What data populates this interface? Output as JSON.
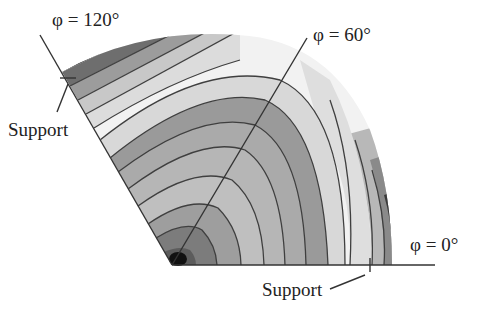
{
  "figure": {
    "type": "contour-plot",
    "labels": {
      "phi_120": "φ = 120°",
      "phi_60": "φ = 60°",
      "phi_0": "φ = 0°",
      "support_left": "Support",
      "support_bottom": "Support"
    },
    "colors": {
      "line": "#3a3a3a",
      "darkest": "#1a1a1a",
      "dark": "#6e6e6e",
      "mid_dark": "#8c8c8c",
      "mid": "#a8a8a8",
      "light": "#c4c4c4",
      "lighter": "#dadada",
      "lightest": "#f4f4f4"
    }
  }
}
